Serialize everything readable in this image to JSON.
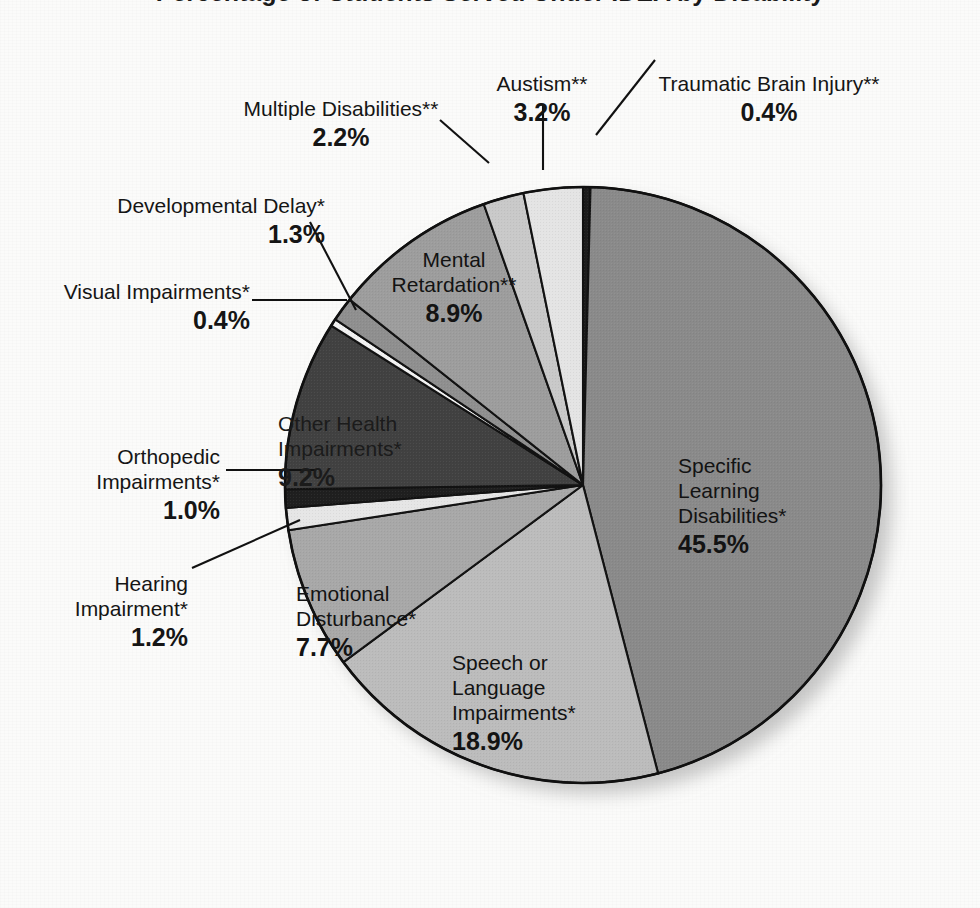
{
  "title": "Percentage of Students Served Under IDEA by Disability",
  "chart_data": {
    "type": "pie",
    "title": "Percentage of Students Served Under IDEA by Disability",
    "legend": "none",
    "units": "percent",
    "start_angle_deg": 0,
    "direction": "clockwise",
    "categories": [
      "Traumatic Brain Injury**",
      "Specific Learning Disabilities*",
      "Speech or Language Impairments*",
      "Emotional Disturbance*",
      "Hearing Impairment*",
      "Orthopedic Impairments*",
      "Other Health Impairments*",
      "Visual Impairments*",
      "Developmental Delay*",
      "Mental Retardation**",
      "Multiple Disabilities**",
      "Austism**"
    ],
    "values": [
      0.4,
      45.5,
      18.9,
      7.7,
      1.2,
      1.0,
      9.2,
      0.4,
      1.3,
      8.9,
      2.2,
      3.2
    ],
    "value_labels": [
      "0.4%",
      "45.5%",
      "18.9%",
      "7.7%",
      "1.2%",
      "1.0%",
      "9.2%",
      "0.4%",
      "1.3%",
      "8.9%",
      "2.2%",
      "3.2%"
    ],
    "colors": [
      "#1d1d1d",
      "#8a8a8a",
      "#bcbcbc",
      "#a8a8a8",
      "#e6e6e6",
      "#1f1f1f",
      "#414141",
      "#f2f2f2",
      "#8f8f8f",
      "#9d9d9d",
      "#c9c9c9",
      "#e4e4e4"
    ],
    "slice_border_color": "#121212"
  },
  "slices": [
    {
      "name": "traumatic-brain-injury",
      "label": "Traumatic Brain Injury**",
      "pct": "0.4%",
      "value": 0.4,
      "color": "#1d1d1d",
      "placement": "outside"
    },
    {
      "name": "specific-learning-disabilities",
      "label": "Specific\nLearning\nDisabilities*",
      "pct": "45.5%",
      "value": 45.5,
      "color": "#8a8a8a",
      "placement": "inside"
    },
    {
      "name": "speech-or-language-impairments",
      "label": "Speech or\nLanguage\nImpairments*",
      "pct": "18.9%",
      "value": 18.9,
      "color": "#bcbcbc",
      "placement": "inside"
    },
    {
      "name": "emotional-disturbance",
      "label": "Emotional\nDisturbance*",
      "pct": "7.7%",
      "value": 7.7,
      "color": "#a8a8a8",
      "placement": "inside"
    },
    {
      "name": "hearing-impairment",
      "label": "Hearing\nImpairment*",
      "pct": "1.2%",
      "value": 1.2,
      "color": "#e6e6e6",
      "placement": "outside"
    },
    {
      "name": "orthopedic-impairments",
      "label": "Orthopedic\nImpairments*",
      "pct": "1.0%",
      "value": 1.0,
      "color": "#1f1f1f",
      "placement": "outside"
    },
    {
      "name": "other-health-impairments",
      "label": "Other Health\nImpairments*",
      "pct": "9.2%",
      "value": 9.2,
      "color": "#414141",
      "placement": "inside"
    },
    {
      "name": "visual-impairments",
      "label": "Visual Impairments*",
      "pct": "0.4%",
      "value": 0.4,
      "color": "#f2f2f2",
      "placement": "outside"
    },
    {
      "name": "developmental-delay",
      "label": "Developmental Delay*",
      "pct": "1.3%",
      "value": 1.3,
      "color": "#8f8f8f",
      "placement": "outside"
    },
    {
      "name": "mental-retardation",
      "label": "Mental\nRetardation**",
      "pct": "8.9%",
      "value": 8.9,
      "color": "#9d9d9d",
      "placement": "inside"
    },
    {
      "name": "multiple-disabilities",
      "label": "Multiple Disabilities**",
      "pct": "2.2%",
      "value": 2.2,
      "color": "#c9c9c9",
      "placement": "outside"
    },
    {
      "name": "austism",
      "label": "Austism**",
      "pct": "3.2%",
      "value": 3.2,
      "color": "#e4e4e4",
      "placement": "outside"
    }
  ],
  "labels": {
    "tbi_name": "Traumatic Brain Injury**",
    "tbi_pct": "0.4%",
    "austism_name": "Austism**",
    "austism_pct": "3.2%",
    "multiple_name": "Multiple Disabilities**",
    "multiple_pct": "2.2%",
    "devdelay_name": "Developmental Delay*",
    "devdelay_pct": "1.3%",
    "visual_name": "Visual Impairments*",
    "visual_pct": "0.4%",
    "orthopedic_name": "Orthopedic\nImpairments*",
    "orthopedic_pct": "1.0%",
    "hearing_name": "Hearing\nImpairment*",
    "hearing_pct": "1.2%",
    "mental_name": "Mental\nRetardation**",
    "mental_pct": "8.9%",
    "otherhealth_name": "Other Health\nImpairments*",
    "otherhealth_pct": "9.2%",
    "emotional_name": "Emotional\nDisturbance*",
    "emotional_pct": "7.7%",
    "speech_name": "Speech or\nLanguage\nImpairments*",
    "speech_pct": "18.9%",
    "sld_name": "Specific\nLearning\nDisabilities*",
    "sld_pct": "45.5%"
  }
}
